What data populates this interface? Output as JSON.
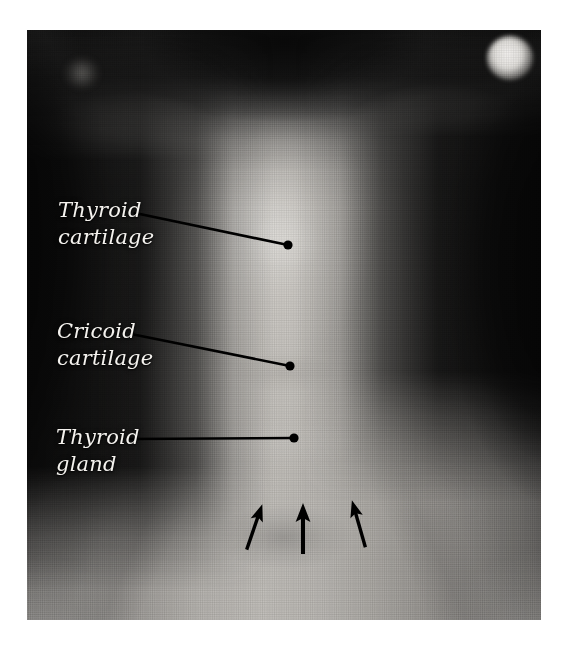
{
  "figure": {
    "kind": "anatomical-photograph",
    "alt": "Black and white photograph of the front of a person's neck with labelled surface landmarks",
    "background_color": "#ffffff",
    "plate": {
      "x": 27,
      "y": 30,
      "width": 514,
      "height": 590
    }
  },
  "annotations": {
    "label_color": "#f4f2ee",
    "leader_color": "#000000",
    "callouts": [
      {
        "id": "thyroid-cartilage",
        "text": "Thyroid\ncartilage",
        "line1": "Thyroid",
        "line2": "cartilage",
        "label_x": 58,
        "label_y": 197,
        "leader": {
          "x1": 135,
          "y1": 213,
          "x2": 288,
          "y2": 245
        },
        "dot": {
          "cx": 288,
          "cy": 245,
          "r": 4.5
        }
      },
      {
        "id": "cricoid-cartilage",
        "text": "Cricoid\ncartilage",
        "line1": "Cricoid",
        "line2": "cartilage",
        "label_x": 57,
        "label_y": 318,
        "leader": {
          "x1": 131,
          "y1": 334,
          "x2": 290,
          "y2": 366
        },
        "dot": {
          "cx": 290,
          "cy": 366,
          "r": 4.5
        }
      },
      {
        "id": "thyroid-gland",
        "text": "Thyroid\ngland",
        "line1": "Thyroid",
        "line2": "gland",
        "label_x": 56,
        "label_y": 424,
        "leader": {
          "x1": 128,
          "y1": 439,
          "x2": 294,
          "y2": 438
        },
        "dot": {
          "cx": 294,
          "cy": 438,
          "r": 4.5
        }
      }
    ],
    "arrows": [
      {
        "id": "arrow-left",
        "tip_x": 261,
        "tip_y": 508,
        "tail_x": 246,
        "tail_y": 551,
        "angle_deg": 19
      },
      {
        "id": "arrow-middle",
        "tip_x": 303,
        "tip_y": 506,
        "tail_x": 303,
        "tail_y": 553,
        "angle_deg": 0
      },
      {
        "id": "arrow-right",
        "tip_x": 353,
        "tip_y": 504,
        "tail_x": 366,
        "tail_y": 548,
        "angle_deg": -16
      }
    ]
  }
}
